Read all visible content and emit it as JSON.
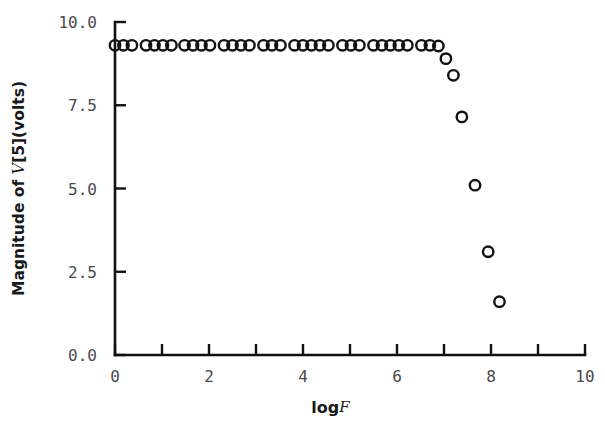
{
  "chart_data": {
    "type": "scatter",
    "title": "",
    "xlabel": "log F",
    "xlabel_prefix": "log",
    "xlabel_italic": "F",
    "ylabel": "Magnitude of V[5](volts)",
    "ylabel_pre": "Magnitude of ",
    "ylabel_italic": "V",
    "ylabel_post": "[5](volts)",
    "xlim": [
      0,
      10
    ],
    "ylim": [
      0,
      10
    ],
    "xticks": [
      0,
      1,
      2,
      3,
      4,
      5,
      6,
      7,
      8,
      9,
      10
    ],
    "xtick_labels": [
      "0",
      "",
      "2",
      "",
      "4",
      "",
      "6",
      "",
      "8",
      "",
      "10"
    ],
    "yticks": [
      0.0,
      2.5,
      5.0,
      7.5,
      10.0
    ],
    "ytick_labels": [
      "0.0",
      "2.5",
      "5.0",
      "7.5",
      "10.0"
    ],
    "grid": false,
    "legend": null,
    "marker": "open-circle",
    "marker_color": "#111111",
    "axis_color": "#111111",
    "points": [
      {
        "x": 0.0,
        "y": 9.3
      },
      {
        "x": 0.18,
        "y": 9.3
      },
      {
        "x": 0.36,
        "y": 9.3
      },
      {
        "x": 0.66,
        "y": 9.3
      },
      {
        "x": 0.84,
        "y": 9.3
      },
      {
        "x": 1.02,
        "y": 9.3
      },
      {
        "x": 1.2,
        "y": 9.3
      },
      {
        "x": 1.48,
        "y": 9.3
      },
      {
        "x": 1.66,
        "y": 9.3
      },
      {
        "x": 1.84,
        "y": 9.3
      },
      {
        "x": 2.02,
        "y": 9.3
      },
      {
        "x": 2.32,
        "y": 9.3
      },
      {
        "x": 2.5,
        "y": 9.3
      },
      {
        "x": 2.68,
        "y": 9.3
      },
      {
        "x": 2.86,
        "y": 9.3
      },
      {
        "x": 3.16,
        "y": 9.3
      },
      {
        "x": 3.34,
        "y": 9.3
      },
      {
        "x": 3.52,
        "y": 9.3
      },
      {
        "x": 3.82,
        "y": 9.3
      },
      {
        "x": 4.0,
        "y": 9.3
      },
      {
        "x": 4.18,
        "y": 9.3
      },
      {
        "x": 4.36,
        "y": 9.3
      },
      {
        "x": 4.54,
        "y": 9.3
      },
      {
        "x": 4.84,
        "y": 9.3
      },
      {
        "x": 5.02,
        "y": 9.3
      },
      {
        "x": 5.2,
        "y": 9.3
      },
      {
        "x": 5.5,
        "y": 9.3
      },
      {
        "x": 5.68,
        "y": 9.3
      },
      {
        "x": 5.86,
        "y": 9.3
      },
      {
        "x": 6.04,
        "y": 9.3
      },
      {
        "x": 6.22,
        "y": 9.3
      },
      {
        "x": 6.52,
        "y": 9.3
      },
      {
        "x": 6.7,
        "y": 9.3
      },
      {
        "x": 6.88,
        "y": 9.28
      },
      {
        "x": 7.04,
        "y": 8.9
      },
      {
        "x": 7.2,
        "y": 8.4
      },
      {
        "x": 7.38,
        "y": 7.15
      },
      {
        "x": 7.66,
        "y": 5.1
      },
      {
        "x": 7.94,
        "y": 3.1
      },
      {
        "x": 8.18,
        "y": 1.6
      }
    ]
  },
  "axes": {
    "plot_left_px": 115,
    "plot_right_px": 585,
    "plot_top_px": 22,
    "plot_bottom_px": 355
  }
}
